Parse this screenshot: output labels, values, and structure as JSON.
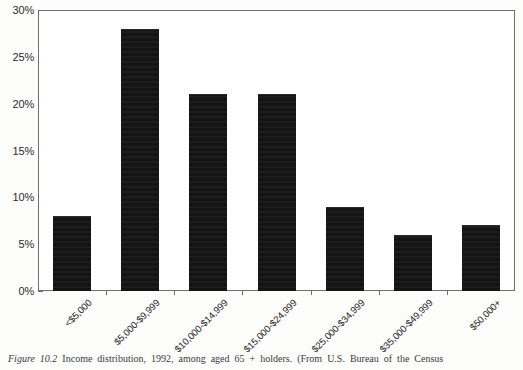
{
  "chart_data": {
    "type": "bar",
    "title": "",
    "subtitle": "",
    "xlabel": "",
    "ylabel": "",
    "categories": [
      "<$5,000",
      "$5,000-$9,999",
      "$10,000-$14,999",
      "$15,000-$24,999",
      "$25,000-$34,999",
      "$35,000-$49,999",
      "$50,000+"
    ],
    "values": [
      8,
      28,
      21,
      21,
      9,
      6,
      7
    ],
    "ylim": [
      0,
      30
    ],
    "ytick_values": [
      0,
      5,
      10,
      15,
      20,
      25,
      30
    ],
    "ytick_labels": [
      "0%",
      "5%",
      "10%",
      "15%",
      "20%",
      "25%",
      "30%"
    ],
    "grid": false,
    "legend": "none",
    "bar_color": "#161616",
    "axis_color": "#6f6f6f",
    "value_unit": "%"
  },
  "caption": {
    "label": "Figure 10.2",
    "text": "Income distribution, 1992, among aged 65 + holders. (From U.S. Bureau of the Census"
  }
}
